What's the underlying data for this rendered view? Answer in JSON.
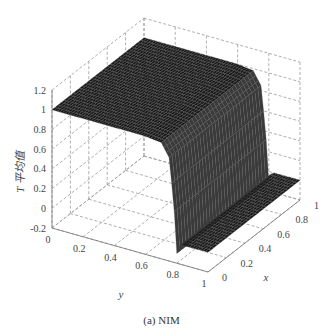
{
  "chart_data": {
    "type": "surface3d",
    "title": "",
    "caption": "(a) NIM",
    "xlabel": "x",
    "ylabel": "y",
    "zlabel": "T 平均值",
    "x_ticks": [
      "0",
      "0.2",
      "0.4",
      "0.6",
      "0.8",
      "1"
    ],
    "y_ticks": [
      "0",
      "0.2",
      "0.4",
      "0.6",
      "0.8",
      "1"
    ],
    "z_ticks": [
      "-0.2",
      "0",
      "0.2",
      "0.4",
      "0.6",
      "0.8",
      "1",
      "1.2"
    ],
    "xlim": [
      0,
      1
    ],
    "ylim": [
      0,
      1
    ],
    "zlim": [
      -0.2,
      1.2
    ],
    "grid": true,
    "profile_along_y": {
      "y": [
        0,
        0.2,
        0.4,
        0.6,
        0.7,
        0.75,
        0.78,
        0.8,
        0.82,
        0.85,
        0.9,
        1.0
      ],
      "T": [
        1.0,
        1.0,
        1.0,
        1.0,
        0.98,
        0.85,
        0.4,
        -0.1,
        0.0,
        0.0,
        0.0,
        0.0
      ]
    },
    "colors": {
      "surface": "#1a1a1a",
      "grid": "#9a9a9a",
      "axis": "#777777"
    }
  }
}
